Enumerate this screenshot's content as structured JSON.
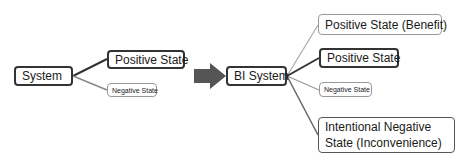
{
  "left": {
    "root": "System",
    "children": [
      "Positive State",
      "Negative State"
    ]
  },
  "transform_arrow": "arrow-right-icon",
  "right": {
    "root": "BI System",
    "children": [
      "Positive State (Benefit)",
      "Positive State",
      "Negative State",
      "Intentional Negative State (Inconvenience)"
    ]
  },
  "colors": {
    "dark_line": "#333333",
    "light_line": "#9a9a9a",
    "arrow": "#555555"
  }
}
